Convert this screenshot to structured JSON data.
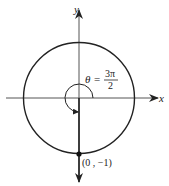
{
  "diagram": {
    "type": "unit-circle",
    "axes": {
      "x_label": "x",
      "y_label": "y"
    },
    "angle": {
      "symbol": "θ",
      "equals": "=",
      "numerator": "3π",
      "denominator": "2"
    },
    "point": {
      "label": "(0 , −1)",
      "x": 0,
      "y": -1
    },
    "colors": {
      "stroke": "#222222",
      "background": "#ffffff"
    }
  }
}
